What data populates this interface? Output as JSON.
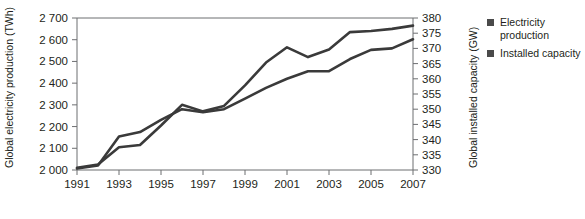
{
  "chart_data": {
    "type": "line",
    "title": "",
    "xlabel": "",
    "ylabel": "Global electricity production (TWh)",
    "y2label": "Global installed capacity (GW)",
    "grid": false,
    "legend_position": "right",
    "x": [
      1991,
      1992,
      1993,
      1994,
      1995,
      1996,
      1997,
      1998,
      1999,
      2000,
      2001,
      2002,
      2003,
      2004,
      2005,
      2006,
      2007
    ],
    "xlim": [
      1991,
      2007
    ],
    "xticks": [
      "1991",
      "1993",
      "1995",
      "1997",
      "1999",
      "2001",
      "2003",
      "2005",
      "2007"
    ],
    "ylim": [
      2000,
      2700
    ],
    "yticks": [
      "2 000",
      "2 100",
      "2 200",
      "2 300",
      "2 400",
      "2 500",
      "2 600",
      "2 700"
    ],
    "y2lim": [
      330,
      380
    ],
    "y2ticks": [
      "330",
      "335",
      "340",
      "345",
      "350",
      "355",
      "360",
      "365",
      "370",
      "375",
      "380"
    ],
    "series": [
      {
        "name": "Electricity production",
        "axis": "left",
        "unit": "TWh",
        "color": "#3a3a3a",
        "values": [
          2010,
          2025,
          2105,
          2115,
          2205,
          2300,
          2270,
          2295,
          2390,
          2495,
          2565,
          2520,
          2555,
          2635,
          2640,
          2650,
          2665
        ]
      },
      {
        "name": "Installed capacity",
        "axis": "right",
        "unit": "GW",
        "color": "#3a3a3a",
        "values": [
          330.5,
          331.5,
          341.0,
          342.5,
          346.5,
          350.0,
          349.0,
          350.0,
          353.5,
          357.0,
          360.0,
          362.5,
          362.5,
          366.5,
          369.5,
          370.0,
          373.0
        ]
      }
    ]
  },
  "legend": {
    "items": [
      {
        "label_line1": "Electricity",
        "label_line2": "production"
      },
      {
        "label_line1": "Installed capacity",
        "label_line2": ""
      }
    ]
  }
}
